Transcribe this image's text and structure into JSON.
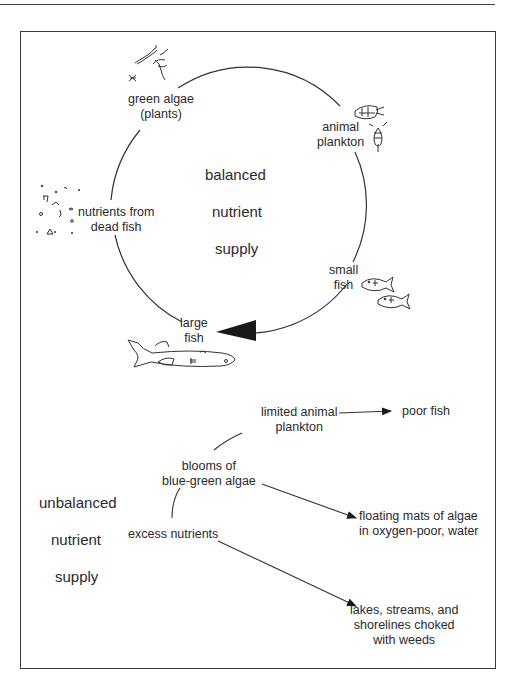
{
  "diagram": {
    "balanced": {
      "center_label": [
        "balanced",
        "nutrient",
        "supply"
      ],
      "cycle_nodes": [
        {
          "id": "green-algae",
          "lines": [
            "green algae",
            "(plants)"
          ],
          "icon": "algae-icon"
        },
        {
          "id": "animal-plankton",
          "lines": [
            "animal",
            "plankton"
          ],
          "icon": "plankton-icon"
        },
        {
          "id": "small-fish",
          "lines": [
            "small",
            "fish"
          ],
          "icon": "small-fish-icon"
        },
        {
          "id": "large-fish",
          "lines": [
            "large",
            "fish"
          ],
          "icon": "large-fish-icon"
        },
        {
          "id": "nutrients-dead-fish",
          "lines": [
            "nutrients from",
            "dead fish"
          ],
          "icon": "debris-icon"
        }
      ],
      "edges": [
        {
          "from": "green-algae",
          "to": "animal-plankton"
        },
        {
          "from": "animal-plankton",
          "to": "small-fish"
        },
        {
          "from": "small-fish",
          "to": "large-fish",
          "arrow": true
        },
        {
          "from": "large-fish",
          "to": "nutrients-dead-fish"
        },
        {
          "from": "nutrients-dead-fish",
          "to": "green-algae"
        }
      ]
    },
    "unbalanced": {
      "side_label": [
        "unbalanced",
        "nutrient",
        "supply"
      ],
      "nodes": [
        {
          "id": "excess-nutrients",
          "lines": [
            "excess nutrients"
          ]
        },
        {
          "id": "blooms",
          "lines": [
            "blooms of",
            "blue-green algae"
          ]
        },
        {
          "id": "limited-plankton",
          "lines": [
            "limited animal",
            "plankton"
          ]
        },
        {
          "id": "poor-fish",
          "lines": [
            "poor fish"
          ]
        },
        {
          "id": "floating-mats",
          "lines": [
            "floating mats of algae",
            "in oxygen-poor, water"
          ]
        },
        {
          "id": "choked",
          "lines": [
            "lakes, streams, and",
            "shorelines choked",
            "with weeds"
          ]
        }
      ],
      "edges": [
        {
          "from": "excess-nutrients",
          "to": "blooms",
          "arrow": false
        },
        {
          "from": "blooms",
          "to": "limited-plankton",
          "arrow": false
        },
        {
          "from": "limited-plankton",
          "to": "poor-fish",
          "arrow": true
        },
        {
          "from": "blooms",
          "to": "floating-mats",
          "arrow": true
        },
        {
          "from": "excess-nutrients",
          "to": "choked",
          "arrow": true
        }
      ]
    }
  }
}
